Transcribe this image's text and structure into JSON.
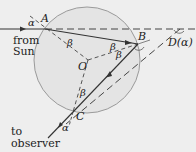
{
  "diagram": {
    "labels": {
      "A": "A",
      "B": "B",
      "C": "C",
      "O": "O",
      "D": "D(α)",
      "alpha_in": "α",
      "alpha_out": "α",
      "beta_A": "β",
      "beta_B1": "β",
      "beta_B2": "β",
      "beta_C": "β"
    },
    "text": {
      "from_line1": "from",
      "from_line2": "Sun",
      "to_line1": "to",
      "to_line2": "observer"
    },
    "colors": {
      "background": "#eeeeee",
      "drop_fill": "#e4e4e4",
      "stroke": "#333333",
      "circle": "#9a9a9a"
    }
  }
}
